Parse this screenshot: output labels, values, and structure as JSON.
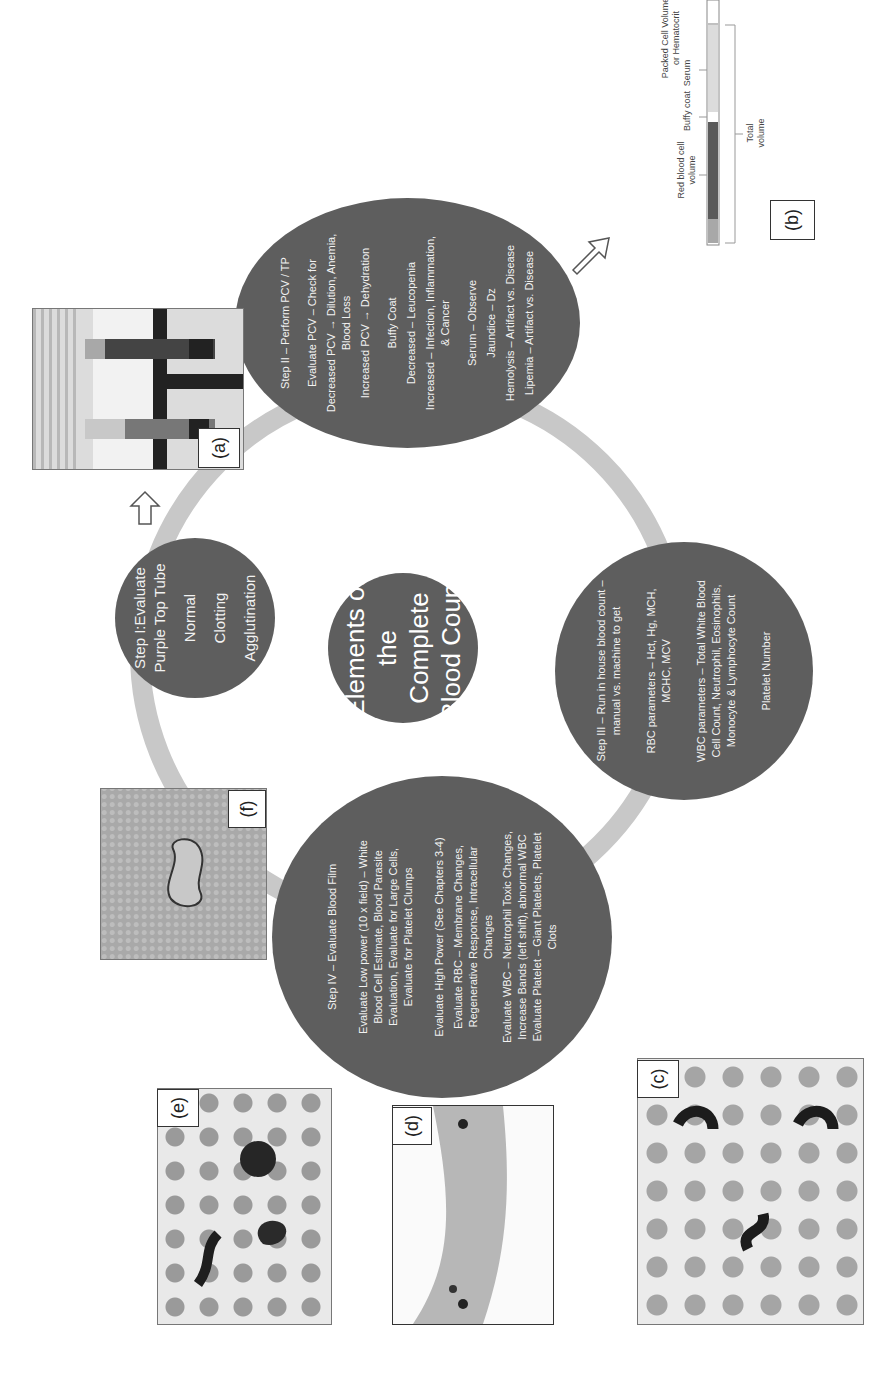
{
  "center": {
    "title_lines": [
      "Elements of",
      "the",
      "Complete",
      "Blood Count"
    ]
  },
  "step1": {
    "title_lines": [
      "Step I:Evaluate",
      "Purple Top Tube"
    ],
    "items": [
      "Normal",
      "Clotting",
      "Agglutination"
    ]
  },
  "step2": {
    "title": "Step II – Perform PCV / TP",
    "lines": [
      "Evaluate PCV – Check for",
      "Decreased PCV → Dilution, Anemia,",
      "Blood Loss",
      "Increased PCV → Dehydration",
      "",
      "Buffy Coat",
      "Decreased – Leucopenia",
      "Increased – Infection, Inflammation,",
      "& Cancer",
      "",
      "Serum – Observe",
      "Jaundice – Dz",
      "Hemolysis – Artifact vs. Disease",
      "Lipemia – Artifact vs. Disease"
    ]
  },
  "step3": {
    "title_lines": [
      "Step III – Run in house blood count –",
      "manual vs. machine to get"
    ],
    "rbc_lines": [
      "RBC parameters – Hct, Hg, MCH,",
      "MCHC, MCV"
    ],
    "wbc_lines": [
      "WBC parameters – Total White Blood",
      "Cell Count, Neutrophil, Eosinophils,",
      "Monocyte & Lymphocyte Count"
    ],
    "platelet": "Platelet Number"
  },
  "step4": {
    "title": "Step IV – Evaluate Blood Film",
    "low_power_lines": [
      "Evaluate Low power (10 x field) – White",
      "Blood Cell Estimate, Blood Parasite",
      "Evaluation, Evaluate for Large Cells,",
      "Evaluate for Platelet Clumps"
    ],
    "high_power": "Evaluate High Power (See Chapters 3-4)",
    "rbc_lines": [
      "Evaluate RBC – Membrane Changes,",
      "Regenerative Response, Intracellular",
      "Changes"
    ],
    "wbc_lines": [
      "Evaluate WBC – Neutrophil Toxic Changes,",
      "Increase Bands (left shift), abnormal WBC"
    ],
    "platelet_lines": [
      "Evaluate Platelet – Giant Platelets, Platelet",
      "Clots"
    ]
  },
  "figures": {
    "a": "(a)",
    "b": "(b)",
    "c": "(c)",
    "d": "(d)",
    "e": "(e)",
    "f": "(f)"
  },
  "hematocrit_diagram": {
    "title_lines": [
      "Packed Cell Volume",
      "or Hematocrit"
    ],
    "serum": "Serum",
    "buffy_coat": "Buffy coat",
    "rbc_volume_lines": [
      "Red blood cell",
      "volume"
    ],
    "total_volume_lines": [
      "Total",
      "volume"
    ]
  },
  "colors": {
    "bubble": "#5e5e5e",
    "ring": "#c8c8c8",
    "text": "#f2f2f2"
  }
}
